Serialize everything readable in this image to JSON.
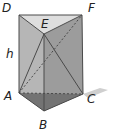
{
  "diagram": {
    "type": "triangular-prism",
    "labels": {
      "D": "D",
      "E": "E",
      "F": "F",
      "A": "A",
      "B": "B",
      "C": "C",
      "h": "h"
    },
    "colors": {
      "top_face": "#d9d9d9",
      "left_face": "#b8b8b8",
      "right_face": "#8e8e8e",
      "bottom_face": "#6f6f6f",
      "shadow": "#c8c8c8",
      "edge": "#4a4a4a",
      "label": "#222222"
    }
  }
}
